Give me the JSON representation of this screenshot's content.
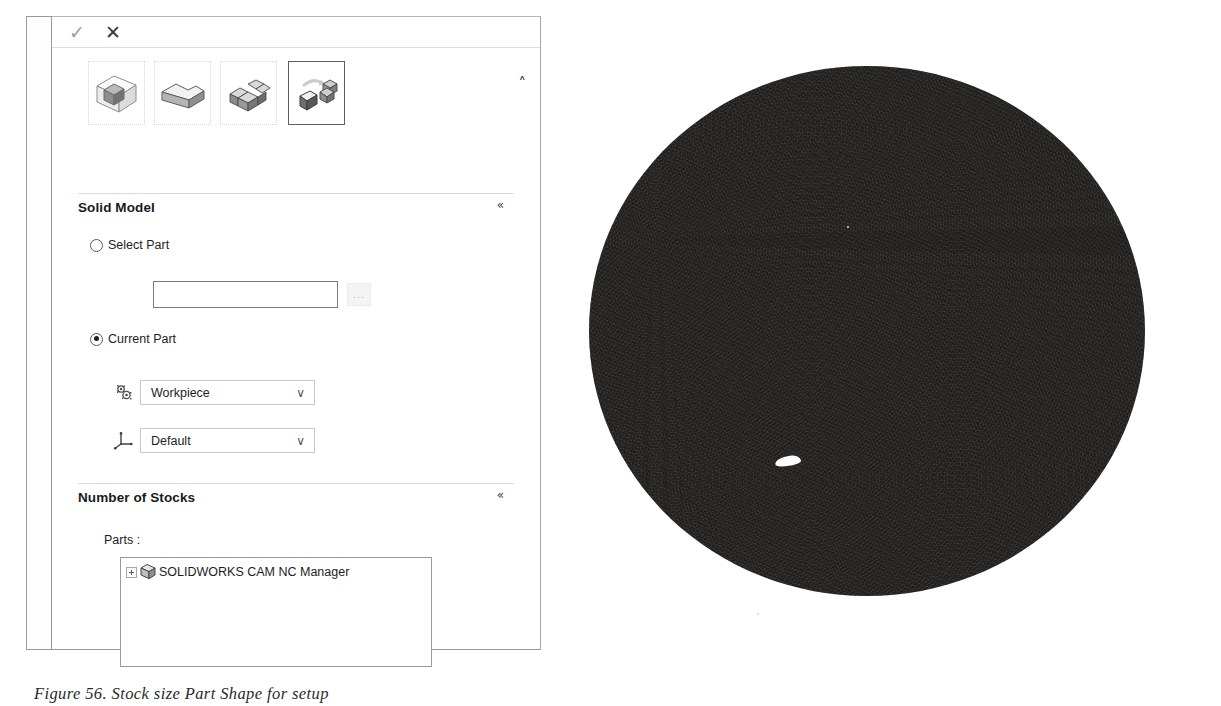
{
  "window": {
    "okbar": {
      "accept_label": "✓",
      "cancel_label": "✕",
      "accept_name": "OK",
      "cancel_name": "Cancel"
    },
    "collapse_chevron": "˄"
  },
  "stock_type_buttons": [
    {
      "name": "bounding-box-stock",
      "selected": false
    },
    {
      "name": "extruded-sketch-stock",
      "selected": false
    },
    {
      "name": "stl-mesh-stock",
      "selected": false
    },
    {
      "name": "part-file-stock",
      "selected": true
    }
  ],
  "solid_model": {
    "title": "Solid Model",
    "collapse_glyph": "«",
    "options": [
      {
        "label": "Select Part",
        "selected": false
      },
      {
        "label": "Current Part",
        "selected": true
      }
    ],
    "part_field_value": "",
    "part_field_placeholder": "",
    "browse_label": "...",
    "combos": [
      {
        "icon": "configuration-icon",
        "value": "Workpiece",
        "arrow": "∨"
      },
      {
        "icon": "coordinate-system-icon",
        "value": "Default",
        "arrow": "∨"
      }
    ]
  },
  "number_of_stocks": {
    "title": "Number of Stocks",
    "collapse_glyph": "«",
    "parts_label": "Parts :",
    "tree": [
      {
        "label": "SOLIDWORKS CAM NC Manager",
        "expander": "+",
        "icon": "cube-icon"
      }
    ]
  },
  "viewport": {
    "name": "graphics-area",
    "background_color": "#ffffff",
    "model_color": "#1d1c1a"
  },
  "caption": {
    "text": "Figure 56. Stock size Part Shape for setup"
  }
}
